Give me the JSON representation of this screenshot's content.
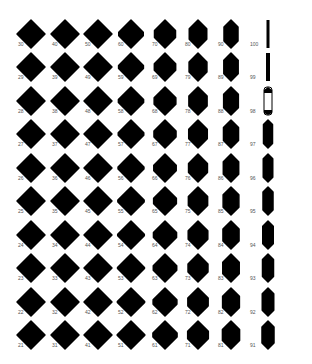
{
  "grid": {
    "columns": [
      30,
      40,
      50,
      60,
      70,
      80,
      90,
      100
    ],
    "rows": 10,
    "row_offsets": [
      0,
      -1,
      -2,
      -3,
      -4,
      -5,
      -6,
      -7,
      -8,
      -9
    ],
    "col_x": [
      31,
      65,
      98,
      131,
      165,
      198,
      231,
      268
    ],
    "row_y": [
      34,
      67,
      101,
      134,
      168,
      201,
      235,
      268,
      302,
      335
    ],
    "shape_color": "#000000",
    "background": "#ffffff",
    "micro_label": "·····"
  },
  "labels": [
    [
      "30",
      "40",
      "50",
      "60",
      "70",
      "80",
      "90",
      "100"
    ],
    [
      "29",
      "39",
      "49",
      "59",
      "69",
      "79",
      "89",
      "99"
    ],
    [
      "28",
      "38",
      "48",
      "58",
      "68",
      "78",
      "88",
      "98"
    ],
    [
      "27",
      "37",
      "47",
      "57",
      "67",
      "77",
      "87",
      "97"
    ],
    [
      "26",
      "36",
      "46",
      "56",
      "66",
      "76",
      "86",
      "96"
    ],
    [
      "25",
      "35",
      "45",
      "55",
      "65",
      "75",
      "85",
      "95"
    ],
    [
      "24",
      "34",
      "44",
      "54",
      "64",
      "74",
      "84",
      "94"
    ],
    [
      "23",
      "33",
      "43",
      "53",
      "63",
      "73",
      "83",
      "93"
    ],
    [
      "22",
      "32",
      "42",
      "52",
      "62",
      "72",
      "82",
      "92"
    ],
    [
      "21",
      "31",
      "41",
      "51",
      "61",
      "71",
      "81",
      "91"
    ]
  ]
}
